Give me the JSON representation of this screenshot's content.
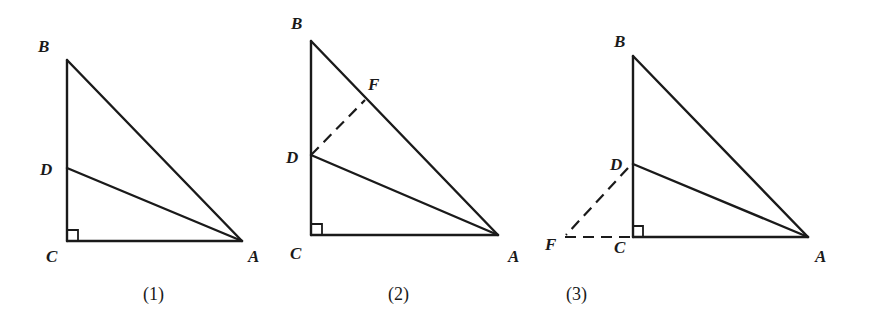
{
  "figures": [
    {
      "caption": "(1)",
      "points": {
        "B": "B",
        "D": "D",
        "C": "C",
        "A": "A"
      },
      "segments": [
        "BC",
        "CA",
        "AB",
        "DA"
      ],
      "dashed": [],
      "right_angle_at": "C"
    },
    {
      "caption": "(2)",
      "points": {
        "B": "B",
        "F": "F",
        "D": "D",
        "C": "C",
        "A": "A"
      },
      "segments": [
        "BC",
        "CA",
        "AB",
        "DA"
      ],
      "dashed": [
        "DF"
      ],
      "right_angle_at": "C"
    },
    {
      "caption": "(3)",
      "points": {
        "B": "B",
        "D": "D",
        "F": "F",
        "C": "C",
        "A": "A"
      },
      "segments": [
        "BC",
        "CA",
        "AB",
        "DA"
      ],
      "dashed": [
        "DF",
        "FC"
      ],
      "right_angle_at": "C"
    }
  ],
  "colors": {
    "line": "#1a1a1a",
    "background": "#ffffff"
  }
}
